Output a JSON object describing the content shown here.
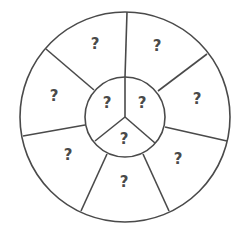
{
  "diagram": {
    "type": "concentric-wheel",
    "outer_ring": {
      "segment_count": 7,
      "segments": [
        {
          "label": "?"
        },
        {
          "label": "?"
        },
        {
          "label": "?"
        },
        {
          "label": "?"
        },
        {
          "label": "?"
        },
        {
          "label": "?"
        },
        {
          "label": "?"
        }
      ]
    },
    "inner_circle": {
      "segment_count": 3,
      "segments": [
        {
          "label": "?"
        },
        {
          "label": "?"
        },
        {
          "label": "?"
        }
      ]
    },
    "colors": {
      "stroke": "#4a4a4a",
      "text": "#4a4a4a",
      "background": "#ffffff"
    }
  }
}
